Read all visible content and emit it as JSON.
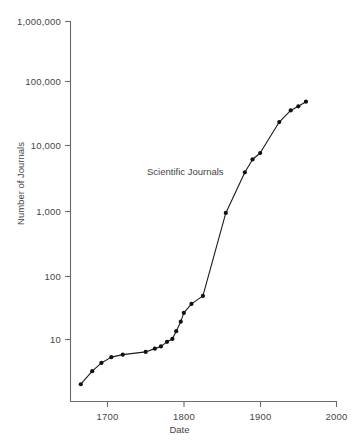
{
  "chart_data": {
    "type": "line",
    "title": "",
    "xlabel": "Date",
    "ylabel": "Number of Journals",
    "yscale": "log",
    "xscale": "linear",
    "xlim": [
      1650,
      2000
    ],
    "ylim": [
      1,
      1000000
    ],
    "grid": false,
    "legend_position": "inline-annotation",
    "annotations": [
      {
        "text": "Scientific Journals",
        "x": 1790,
        "y": 2200
      }
    ],
    "xticks": [
      1700,
      1800,
      1900,
      2000
    ],
    "xtick_labels": [
      "1700",
      "1800",
      "1900",
      "2000"
    ],
    "yticks": [
      10,
      100,
      1000,
      10000,
      100000,
      1000000
    ],
    "ytick_labels": [
      "10",
      "100",
      "1,000",
      "10,000",
      "100,000",
      "1,000,000"
    ],
    "series": [
      {
        "name": "Scientific Journals",
        "marker": "filled-circle",
        "color": "#1a1a1a",
        "x": [
          1665,
          1680,
          1692,
          1705,
          1720,
          1750,
          1762,
          1770,
          1778,
          1785,
          1790,
          1796,
          1800,
          1810,
          1825,
          1855,
          1880,
          1890,
          1900,
          1925,
          1940,
          1950,
          1960
        ],
        "y": [
          2,
          3.2,
          4.3,
          5.3,
          5.8,
          6.4,
          7.2,
          7.8,
          9.2,
          10.2,
          13.5,
          19,
          26,
          36,
          48,
          950,
          4100,
          6500,
          8200,
          25000,
          38000,
          44000,
          52000
        ]
      }
    ]
  },
  "axes": {
    "x_title": "Date",
    "y_title": "Number of Journals"
  },
  "colors": {
    "line": "#1a1a1a",
    "marker": "#111111",
    "axis": "#6b6b6b",
    "text": "#454545",
    "background": "#ffffff"
  }
}
